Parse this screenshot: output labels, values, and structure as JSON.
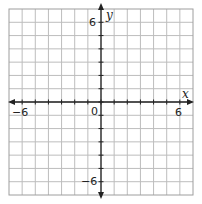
{
  "diagram": {
    "type": "coordinate-plane",
    "x_axis": {
      "label": "x",
      "min": -7,
      "max": 7,
      "labeled_ticks": [
        "-6",
        "6"
      ]
    },
    "y_axis": {
      "label": "y",
      "min": -7,
      "max": 7,
      "labeled_ticks": [
        "6",
        "-6"
      ]
    },
    "origin_label": "0",
    "labels": {
      "x": "x",
      "y": "y",
      "origin": "0",
      "x_neg": "−6",
      "x_pos": "6",
      "y_pos": "6",
      "y_neg": "−6"
    },
    "grid": {
      "cells": 14,
      "line_color": "#bdbdbd",
      "border_color": "#9e9e9e",
      "axis_color": "#222222"
    }
  }
}
